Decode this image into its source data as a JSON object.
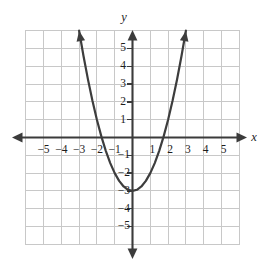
{
  "figure": {
    "width": 272,
    "height": 266,
    "background": "#ffffff"
  },
  "colors": {
    "grid": "#c8c8c8",
    "axis": "#3b3b3b",
    "curve": "#3d3d3d",
    "text": "#1d1d1d"
  },
  "axes": {
    "x_name": "x",
    "y_name": "y",
    "x_tick_labels": [
      "−5",
      "−4",
      "−3",
      "−2",
      "−1",
      "1",
      "2",
      "3",
      "4",
      "5"
    ],
    "y_tick_labels": [
      "5",
      "4",
      "3",
      "2",
      "1",
      "−1",
      "−2",
      "−3",
      "−4",
      "−5"
    ]
  },
  "chart_data": {
    "type": "line",
    "title": "",
    "xlabel": "x",
    "ylabel": "y",
    "xlim": [
      -6,
      6
    ],
    "ylim": [
      -6,
      6
    ],
    "grid": true,
    "legend": "none",
    "equation": "y = x^2 - 3",
    "vertex": [
      0,
      -3
    ],
    "x_intercepts": [
      -1.73,
      1.73
    ],
    "y_intercept": -3,
    "x_ticks": [
      -5,
      -4,
      -3,
      -2,
      -1,
      1,
      2,
      3,
      4,
      5
    ],
    "y_ticks": [
      5,
      4,
      3,
      2,
      1,
      -1,
      -2,
      -3,
      -4,
      -5
    ],
    "series": [
      {
        "name": "y = x^2 - 3",
        "x": [
          -3.0,
          -2.75,
          -2.5,
          -2.25,
          -2.0,
          -1.75,
          -1.5,
          -1.25,
          -1.0,
          -0.75,
          -0.5,
          -0.25,
          0.0,
          0.25,
          0.5,
          0.75,
          1.0,
          1.25,
          1.5,
          1.75,
          2.0,
          2.25,
          2.5,
          2.75,
          3.0
        ],
        "y": [
          6.0,
          4.5625,
          3.25,
          2.0625,
          1.0,
          0.0625,
          -0.75,
          -1.4375,
          -2.0,
          -2.4375,
          -2.75,
          -2.9375,
          -3.0,
          -2.9375,
          -2.75,
          -2.4375,
          -2.0,
          -1.4375,
          -0.75,
          0.0625,
          1.0,
          2.0625,
          3.25,
          4.5625,
          6.0
        ]
      }
    ]
  }
}
